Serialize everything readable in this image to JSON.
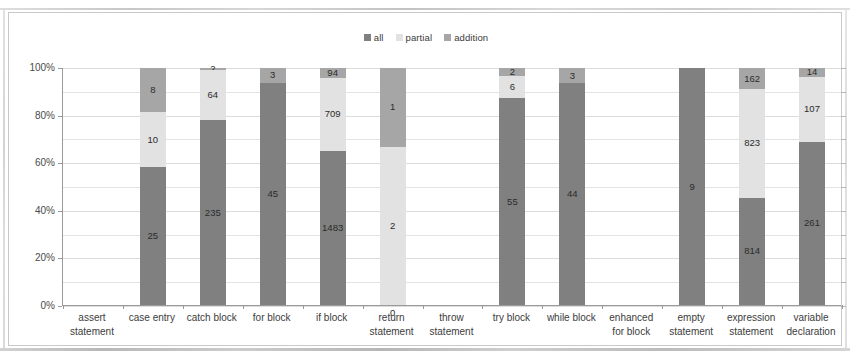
{
  "chart_data": {
    "type": "bar",
    "subtype": "100% stacked bar",
    "title": "",
    "xlabel": "",
    "ylabel": "",
    "ylim": [
      0,
      100
    ],
    "yticks": [
      "0%",
      "20%",
      "40%",
      "60%",
      "80%",
      "100%"
    ],
    "grid": true,
    "legend_position": "top-center",
    "legend": [
      "all",
      "partial",
      "addition"
    ],
    "colors": {
      "all": "#808080",
      "partial": "#e2e2e2",
      "addition": "#a6a6a6",
      "axis": "#9a9a9a",
      "grid": "#e3e3e3",
      "text": "#3c3c3c",
      "frame": "#c9c9c9",
      "background": "#ffffff"
    },
    "categories": [
      "assert statement",
      "case entry",
      "catch block",
      "for block",
      "if block",
      "return statement",
      "throw statement",
      "try block",
      "while block",
      "enhanced for block",
      "empty statement",
      "expression statement",
      "variable declaration"
    ],
    "category_lines": [
      [
        "assert",
        "statement"
      ],
      [
        "case entry"
      ],
      [
        "catch block"
      ],
      [
        "for block"
      ],
      [
        "if block"
      ],
      [
        "return",
        "statement"
      ],
      [
        "throw",
        "statement"
      ],
      [
        "try block"
      ],
      [
        "while block"
      ],
      [
        "enhanced",
        "for block"
      ],
      [
        "empty",
        "statement"
      ],
      [
        "expression",
        "statement"
      ],
      [
        "variable",
        "declaration"
      ]
    ],
    "series": [
      {
        "name": "all",
        "values": [
          null,
          25,
          235,
          45,
          1483,
          0,
          null,
          55,
          44,
          null,
          9,
          814,
          261
        ]
      },
      {
        "name": "partial",
        "values": [
          null,
          10,
          64,
          null,
          709,
          2,
          null,
          6,
          null,
          null,
          null,
          823,
          107
        ]
      },
      {
        "name": "addition",
        "values": [
          null,
          8,
          2,
          3,
          94,
          1,
          null,
          2,
          3,
          null,
          null,
          162,
          14
        ]
      }
    ],
    "bars": [
      {
        "category": "assert statement",
        "empty": true,
        "segments": []
      },
      {
        "category": "case entry",
        "empty": false,
        "segments": [
          {
            "series": "addition",
            "value": 8,
            "pct": 18.6,
            "label": "8"
          },
          {
            "series": "partial",
            "value": 10,
            "pct": 23.3,
            "label": "10"
          },
          {
            "series": "all",
            "value": 25,
            "pct": 58.1,
            "label": "25"
          }
        ]
      },
      {
        "category": "catch block",
        "empty": false,
        "segments": [
          {
            "series": "addition",
            "value": 2,
            "pct": 0.7,
            "label": "2"
          },
          {
            "series": "partial",
            "value": 64,
            "pct": 21.3,
            "label": "64"
          },
          {
            "series": "all",
            "value": 235,
            "pct": 78.0,
            "label": "235"
          }
        ]
      },
      {
        "category": "for block",
        "empty": false,
        "segments": [
          {
            "series": "addition",
            "value": 3,
            "pct": 6.3,
            "label": "3"
          },
          {
            "series": "all",
            "value": 45,
            "pct": 93.7,
            "label": "45"
          }
        ]
      },
      {
        "category": "if block",
        "empty": false,
        "segments": [
          {
            "series": "addition",
            "value": 94,
            "pct": 4.1,
            "label": "94"
          },
          {
            "series": "partial",
            "value": 709,
            "pct": 31.0,
            "label": "709"
          },
          {
            "series": "all",
            "value": 1483,
            "pct": 64.9,
            "label": "1483"
          }
        ]
      },
      {
        "category": "return statement",
        "empty": false,
        "segments": [
          {
            "series": "addition",
            "value": 1,
            "pct": 33.3,
            "label": "1"
          },
          {
            "series": "partial",
            "value": 2,
            "pct": 66.7,
            "label": "2"
          },
          {
            "series": "all",
            "value": 0,
            "pct": 0,
            "label": "0",
            "label_outside": true
          }
        ]
      },
      {
        "category": "throw statement",
        "empty": true,
        "segments": []
      },
      {
        "category": "try block",
        "empty": false,
        "segments": [
          {
            "series": "addition",
            "value": 2,
            "pct": 3.2,
            "label": "2"
          },
          {
            "series": "partial",
            "value": 6,
            "pct": 9.5,
            "label": "6"
          },
          {
            "series": "all",
            "value": 55,
            "pct": 87.3,
            "label": "55"
          }
        ]
      },
      {
        "category": "while block",
        "empty": false,
        "segments": [
          {
            "series": "addition",
            "value": 3,
            "pct": 6.4,
            "label": "3"
          },
          {
            "series": "all",
            "value": 44,
            "pct": 93.6,
            "label": "44"
          }
        ]
      },
      {
        "category": "enhanced for block",
        "empty": true,
        "segments": []
      },
      {
        "category": "empty statement",
        "empty": false,
        "segments": [
          {
            "series": "all",
            "value": 9,
            "pct": 100,
            "label": "9"
          }
        ]
      },
      {
        "category": "expression statement",
        "empty": false,
        "segments": [
          {
            "series": "addition",
            "value": 162,
            "pct": 9.0,
            "label": "162"
          },
          {
            "series": "partial",
            "value": 823,
            "pct": 45.7,
            "label": "823"
          },
          {
            "series": "all",
            "value": 814,
            "pct": 45.3,
            "label": "814"
          }
        ]
      },
      {
        "category": "variable declaration",
        "empty": false,
        "segments": [
          {
            "series": "addition",
            "value": 14,
            "pct": 3.6,
            "label": "14"
          },
          {
            "series": "partial",
            "value": 107,
            "pct": 27.6,
            "label": "107"
          },
          {
            "series": "all",
            "value": 261,
            "pct": 68.8,
            "label": "261"
          }
        ]
      }
    ]
  }
}
